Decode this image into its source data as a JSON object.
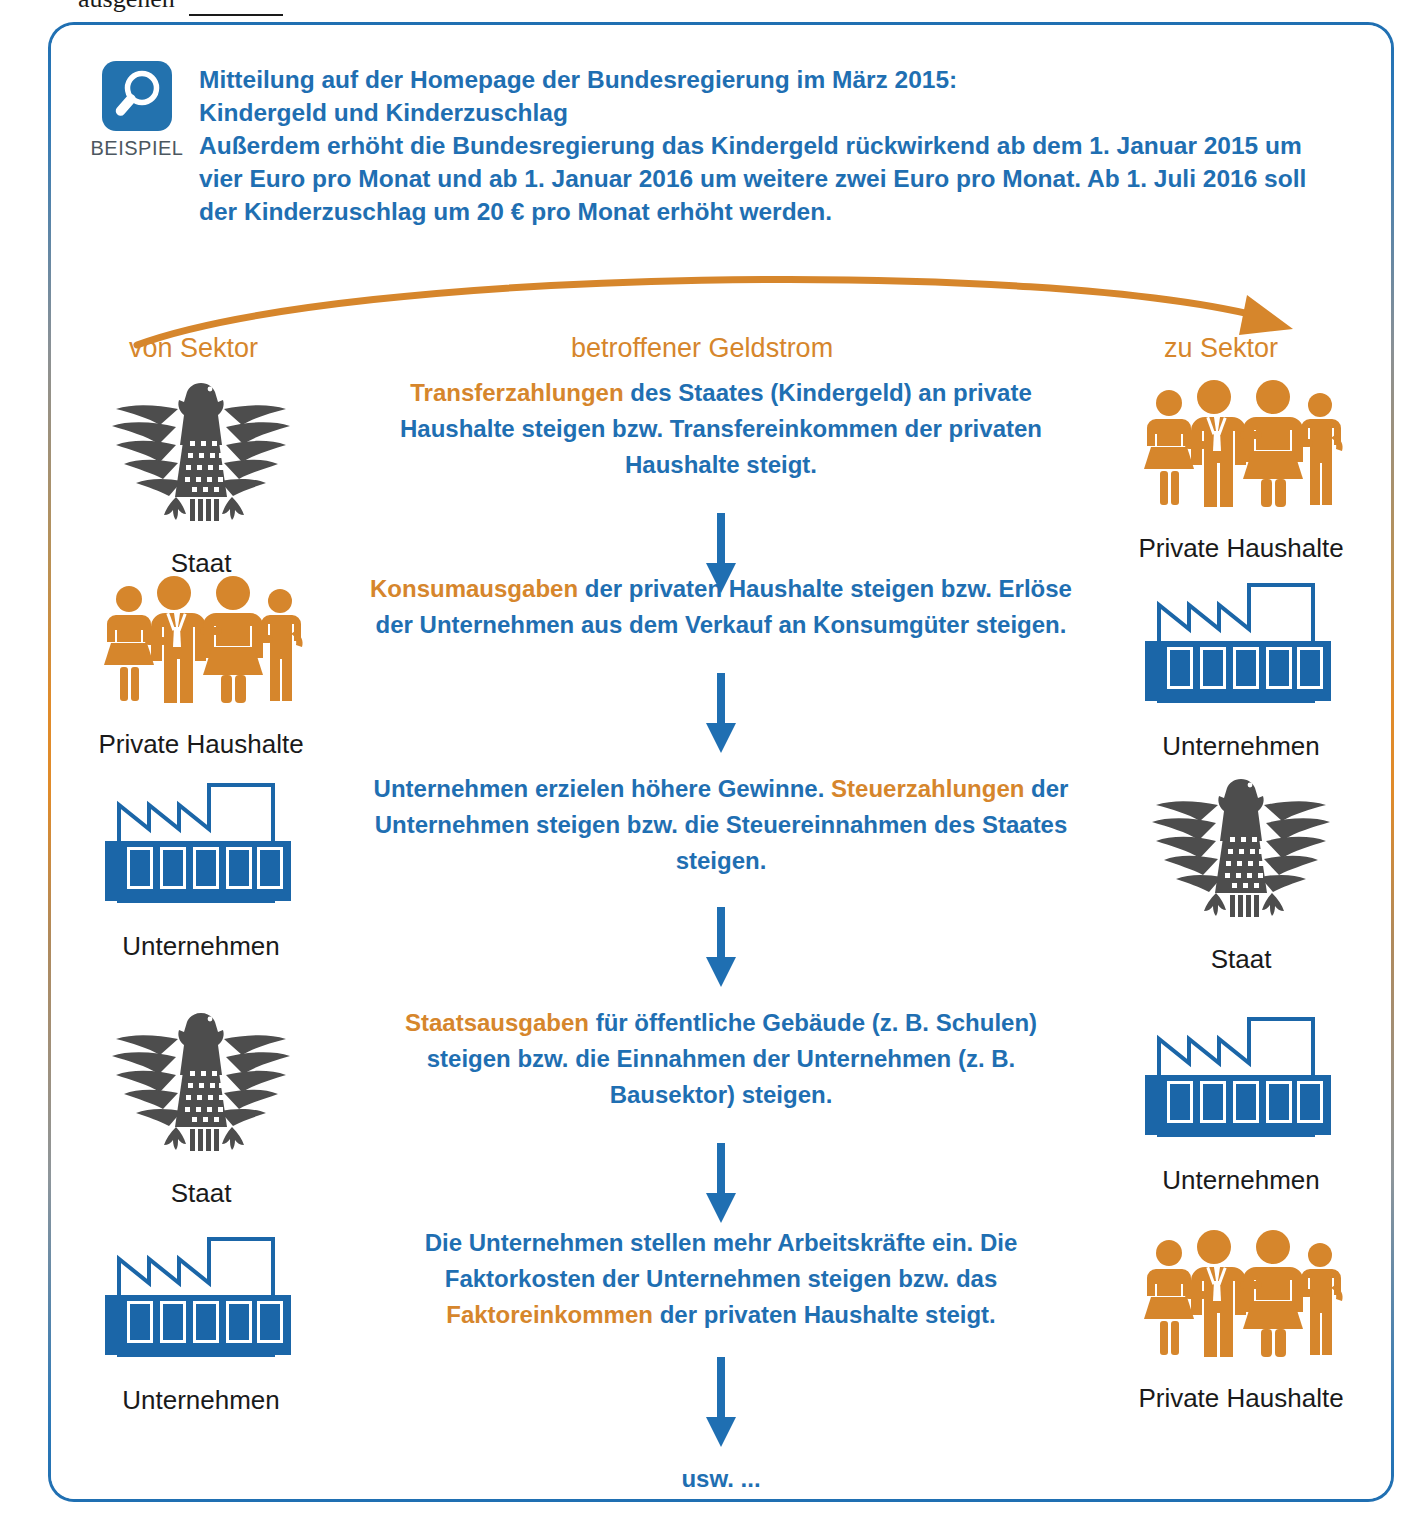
{
  "page": {
    "clipped_top_text": "ausgehen",
    "clipped_top_blank": "Antwort"
  },
  "example_box": {
    "badge_label": "BEISPIEL",
    "badge_icon": "magnifier-icon",
    "intro_line": "Mitteilung auf der Homepage der Bundesregierung im März 2015:",
    "title": "Kindergeld und Kinderzuschlag",
    "body": "Außerdem erhöht die Bundesregierung das Kindergeld rückwirkend ab dem 1. Januar 2015 um vier Euro pro Monat und ab 1. Januar 2016 um weitere zwei Euro pro Monat. Ab 1. Juli 2016 soll der Kinderzuschlag um 20 € pro Monat erhöht werden."
  },
  "columns": {
    "from_label": "von Sektor",
    "middle_label": "betroffener Geldstrom",
    "to_label": "zu Sektor"
  },
  "colors": {
    "blue": "#1f6fb2",
    "orange": "#d6862c",
    "eagle_gray": "#4d4d4d",
    "factory_blue": "#1b66a8",
    "badge_blue": "#2372ae",
    "text_black": "#1a1a1a"
  },
  "rows": [
    {
      "from_sector": "Staat",
      "from_icon": "eagle-icon",
      "to_sector": "Private Haushalte",
      "to_icon": "family-icon",
      "text_parts": [
        {
          "t": "Transferzahlungen",
          "hl": true
        },
        {
          "t": " des Staates (Kindergeld) an private Haushalte steigen bzw. Transfereinkommen der privaten Haushalte steigt.",
          "hl": false
        }
      ]
    },
    {
      "from_sector": "Private Haushalte",
      "from_icon": "family-icon",
      "to_sector": "Unternehmen",
      "to_icon": "factory-icon",
      "text_parts": [
        {
          "t": "Konsumausgaben",
          "hl": true
        },
        {
          "t": " der privaten Haushalte steigen bzw. Erlöse der Unternehmen aus dem Verkauf an Konsumgüter steigen.",
          "hl": false
        }
      ]
    },
    {
      "from_sector": "Unternehmen",
      "from_icon": "factory-icon",
      "to_sector": "Staat",
      "to_icon": "eagle-icon",
      "text_parts": [
        {
          "t": "Unternehmen erzielen höhere Gewinne. ",
          "hl": false
        },
        {
          "t": "Steuerzahlungen",
          "hl": true
        },
        {
          "t": " der Unternehmen steigen bzw. die Steuereinnahmen des Staates steigen.",
          "hl": false
        }
      ]
    },
    {
      "from_sector": "Staat",
      "from_icon": "eagle-icon",
      "to_sector": "Unternehmen",
      "to_icon": "factory-icon",
      "text_parts": [
        {
          "t": "Staatsausgaben",
          "hl": true
        },
        {
          "t": " für öffentliche Gebäude (z. B. Schulen) steigen bzw. die Einnahmen der Unternehmen (z. B. Bausektor) steigen.",
          "hl": false
        }
      ]
    },
    {
      "from_sector": "Unternehmen",
      "from_icon": "factory-icon",
      "to_sector": "Private Haushalte",
      "to_icon": "family-icon",
      "text_parts": [
        {
          "t": "Die Unternehmen stellen mehr Arbeitskräfte ein. Die Faktorkosten der Unternehmen steigen bzw. das ",
          "hl": false
        },
        {
          "t": "Faktoreinkommen",
          "hl": true
        },
        {
          "t": " der privaten Haushalte steigt.",
          "hl": false
        }
      ]
    }
  ],
  "footer": {
    "usw": "usw. ..."
  }
}
